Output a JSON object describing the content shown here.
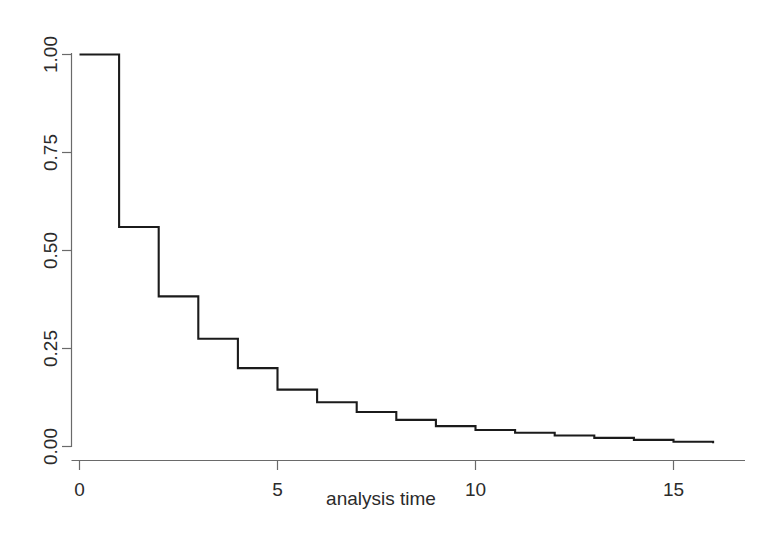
{
  "chart_data": {
    "type": "line",
    "subtype": "step-post",
    "title": "",
    "subtitle": "",
    "xlabel": "analysis time",
    "ylabel": "",
    "xlim": [
      0,
      16.4
    ],
    "ylim": [
      0.0,
      1.0
    ],
    "grid": false,
    "legend": false,
    "legend_position": "none",
    "xticks": [
      0,
      5,
      10,
      15
    ],
    "xticklabels": [
      "0",
      "5",
      "10",
      "15"
    ],
    "yticks": [
      0.0,
      0.25,
      0.5,
      0.75,
      1.0
    ],
    "yticklabels": [
      "0.00",
      "0.25",
      "0.50",
      "0.75",
      "1.00"
    ],
    "series": [
      {
        "name": "survivor function",
        "color": "#1b1b1b",
        "x": [
          0,
          1,
          2,
          3,
          4,
          5,
          6,
          7,
          8,
          9,
          10,
          11,
          12,
          13,
          14,
          15,
          16
        ],
        "values": [
          1.0,
          0.56,
          0.383,
          0.275,
          0.2,
          0.145,
          0.113,
          0.088,
          0.068,
          0.052,
          0.042,
          0.035,
          0.028,
          0.022,
          0.017,
          0.012,
          0.008
        ]
      }
    ],
    "annotations": []
  },
  "axis": {
    "x_title": "analysis time",
    "y_title": ""
  }
}
